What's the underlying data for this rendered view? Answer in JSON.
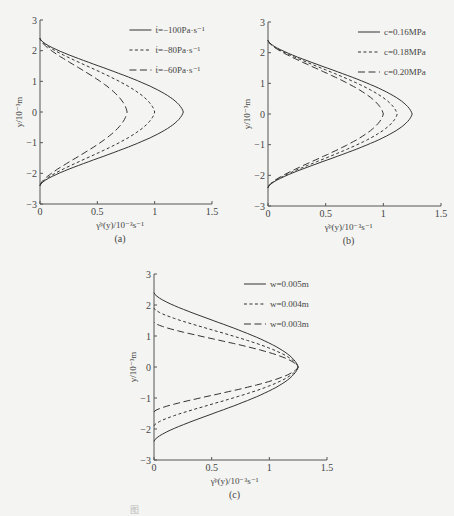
{
  "figure": {
    "caption": "图"
  },
  "chart_data": [
    {
      "id": "a",
      "type": "line",
      "subtitle": "(a)",
      "xlabel": "γ̇ᵖ(y)/10⁻³s⁻¹",
      "ylabel": "y/10⁻³m",
      "xlim": [
        0,
        1.5
      ],
      "ylim": [
        -3,
        3
      ],
      "xticks": [
        "0",
        "0.5",
        "1",
        "1.5"
      ],
      "yticks": [
        "-3",
        "-2",
        "-1",
        "0",
        "1",
        "2",
        "3"
      ],
      "grid": false,
      "legend_position": "upper right",
      "series": [
        {
          "name": "ṫ=−100Pa·s⁻¹",
          "style": "solid",
          "peak": 1.25,
          "half_width": 2.4
        },
        {
          "name": "ṫ=−80Pa·s⁻¹",
          "style": "short-dash",
          "peak": 1.0,
          "half_width": 2.4
        },
        {
          "name": "ṫ=−60Pa·s⁻¹",
          "style": "long-dash",
          "peak": 0.76,
          "half_width": 2.4
        }
      ]
    },
    {
      "id": "b",
      "type": "line",
      "subtitle": "(b)",
      "xlabel": "γ̇ᵖ(y)/10⁻³s⁻¹",
      "ylabel": "y/10⁻³m",
      "xlim": [
        0,
        1.5
      ],
      "ylim": [
        -3,
        3
      ],
      "xticks": [
        "0",
        "0.5",
        "1",
        "1.5"
      ],
      "yticks": [
        "-3",
        "-2",
        "-1",
        "0",
        "1",
        "2",
        "3"
      ],
      "grid": false,
      "legend_position": "upper right",
      "series": [
        {
          "name": "c=0.16MPa",
          "style": "solid",
          "peak": 1.25,
          "half_width": 2.4
        },
        {
          "name": "c=0.18MPa",
          "style": "short-dash",
          "peak": 1.12,
          "half_width": 2.4
        },
        {
          "name": "c=0.20MPa",
          "style": "long-dash",
          "peak": 1.0,
          "half_width": 2.4
        }
      ]
    },
    {
      "id": "c",
      "type": "line",
      "subtitle": "(c)",
      "xlabel": "γ̇ᵖ(y)/10⁻³s⁻¹",
      "ylabel": "y/10⁻³m",
      "xlim": [
        0,
        1.5
      ],
      "ylim": [
        -3,
        3
      ],
      "xticks": [
        "0",
        "0.5",
        "1",
        "1.5"
      ],
      "yticks": [
        "-3",
        "-2",
        "-1",
        "0",
        "1",
        "2",
        "3"
      ],
      "grid": false,
      "legend_position": "upper right",
      "series": [
        {
          "name": "w=0.005m",
          "style": "solid",
          "peak": 1.25,
          "half_width": 2.4
        },
        {
          "name": "w=0.004m",
          "style": "short-dash",
          "peak": 1.25,
          "half_width": 1.9
        },
        {
          "name": "w=0.003m",
          "style": "long-dash",
          "peak": 1.25,
          "half_width": 1.45
        }
      ]
    }
  ],
  "layout": {
    "panels": [
      {
        "left": 40,
        "top": 20,
        "width": 172,
        "height": 184
      },
      {
        "left": 268,
        "top": 22,
        "width": 173,
        "height": 184
      },
      {
        "left": 154,
        "top": 274,
        "width": 173,
        "height": 186
      }
    ],
    "line_color": "#333333",
    "axis_color": "#555555"
  }
}
